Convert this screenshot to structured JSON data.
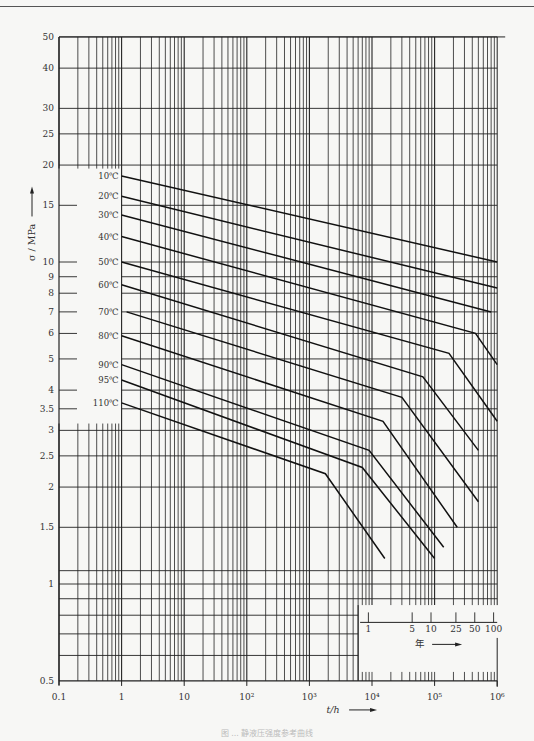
{
  "chart_data": {
    "type": "line",
    "title": "",
    "xlabel": "t/h",
    "ylabel": "σ/MPa",
    "x_scale": "log",
    "y_scale": "log",
    "xlim": [
      0.1,
      1000000
    ],
    "ylim": [
      0.5,
      50
    ],
    "grid": true,
    "x_ticks": [
      {
        "value": 0.1,
        "label": "0.1"
      },
      {
        "value": 1,
        "label": "1"
      },
      {
        "value": 10,
        "label": "10"
      },
      {
        "value": 100,
        "label": "10²"
      },
      {
        "value": 1000,
        "label": "10³"
      },
      {
        "value": 10000,
        "label": "10⁴"
      },
      {
        "value": 100000,
        "label": "10⁵"
      },
      {
        "value": 1000000,
        "label": "10⁶"
      }
    ],
    "y_ticks": [
      {
        "value": 0.5,
        "label": "0.5"
      },
      {
        "value": 1,
        "label": "1"
      },
      {
        "value": 1.5,
        "label": "1.5"
      },
      {
        "value": 2,
        "label": "2"
      },
      {
        "value": 2.5,
        "label": "2.5"
      },
      {
        "value": 3,
        "label": "3"
      },
      {
        "value": 3.5,
        "label": "3.5"
      },
      {
        "value": 4,
        "label": "4"
      },
      {
        "value": 5,
        "label": "5"
      },
      {
        "value": 6,
        "label": "6"
      },
      {
        "value": 7,
        "label": "7"
      },
      {
        "value": 8,
        "label": "8"
      },
      {
        "value": 9,
        "label": "9"
      },
      {
        "value": 10,
        "label": "10"
      },
      {
        "value": 15,
        "label": "15"
      },
      {
        "value": 20,
        "label": "20"
      },
      {
        "value": 25,
        "label": "25"
      },
      {
        "value": 30,
        "label": "30"
      },
      {
        "value": 40,
        "label": "40"
      },
      {
        "value": 50,
        "label": "50"
      }
    ],
    "secondary_x_axis": {
      "label": "年",
      "ticks": [
        {
          "value": 1,
          "label": "1"
        },
        {
          "value": 5,
          "label": "5"
        },
        {
          "value": 10,
          "label": "10"
        },
        {
          "value": 25,
          "label": "25"
        },
        {
          "value": 50,
          "label": "50"
        },
        {
          "value": 100,
          "label": "100"
        }
      ]
    },
    "series": [
      {
        "name": "10℃",
        "points": [
          [
            1,
            18.5
          ],
          [
            1000000,
            10
          ]
        ]
      },
      {
        "name": "20℃",
        "points": [
          [
            1,
            16
          ],
          [
            1000000,
            8.3
          ]
        ]
      },
      {
        "name": "30℃",
        "points": [
          [
            1,
            14
          ],
          [
            800000,
            7
          ]
        ]
      },
      {
        "name": "40℃",
        "points": [
          [
            1,
            12
          ],
          [
            450000,
            6
          ],
          [
            1000000,
            4.8
          ]
        ]
      },
      {
        "name": "50℃",
        "points": [
          [
            1,
            10
          ],
          [
            170000,
            5.2
          ],
          [
            1000000,
            3.2
          ]
        ]
      },
      {
        "name": "60℃",
        "points": [
          [
            1,
            8.5
          ],
          [
            65000,
            4.4
          ],
          [
            500000,
            2.6
          ]
        ]
      },
      {
        "name": "70℃",
        "points": [
          [
            1.2,
            7
          ],
          [
            30000,
            3.8
          ],
          [
            500000,
            1.8
          ]
        ]
      },
      {
        "name": "80℃",
        "points": [
          [
            1,
            5.9
          ],
          [
            15000,
            3.2
          ],
          [
            230000,
            1.5
          ]
        ]
      },
      {
        "name": "90℃",
        "points": [
          [
            1,
            4.8
          ],
          [
            9000,
            2.6
          ],
          [
            140000,
            1.3
          ]
        ]
      },
      {
        "name": "95℃",
        "points": [
          [
            1,
            4.3
          ],
          [
            7000,
            2.3
          ],
          [
            100000,
            1.2
          ]
        ]
      },
      {
        "name": "110℃",
        "points": [
          [
            1,
            3.65
          ],
          [
            1800,
            2.2
          ],
          [
            16000,
            1.2
          ]
        ]
      }
    ]
  },
  "labels": {
    "xlabel": "t/h",
    "ylabel": "σ / MPa",
    "years_label": "年"
  },
  "caption": "图 ... 静液压强度参考曲线"
}
